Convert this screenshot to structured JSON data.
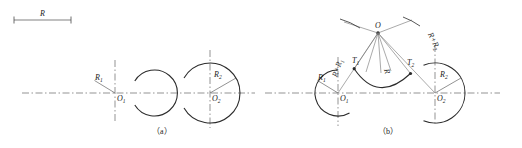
{
  "figure": {
    "title_visible": false,
    "panels": [
      {
        "id": "a",
        "caption": "（a）",
        "description": "Two separate circular arcs with centers O1 and O2 on a common horizontal centerline",
        "labels": {
          "radius_left": "R",
          "radius_left_sub": "1",
          "center_left": "O",
          "center_left_sub": "1",
          "radius_right": "R",
          "radius_right_sub": "2",
          "center_right": "O",
          "center_right_sub": "2"
        }
      },
      {
        "id": "b",
        "caption": "（b）",
        "description": "The two arcs joined by a tangent arc of radius R struck from construction point O",
        "labels": {
          "radius_left": "R",
          "radius_left_sub": "1",
          "center_left": "O",
          "center_left_sub": "1",
          "radius_right": "R",
          "radius_right_sub": "2",
          "center_right": "O",
          "center_right_sub": "2",
          "construction_center": "O",
          "sum_left": "R+R",
          "sum_left_sub": "1",
          "sum_right": "R+R",
          "sum_right_sub": "2",
          "blend_radius": "R",
          "tangent_left": "T",
          "tangent_left_sub": "1",
          "tangent_right": "T",
          "tangent_right_sub": "2"
        }
      }
    ],
    "scale_bar": {
      "label": "R",
      "description": "Horizontal dimension bar at top-left indicating length R"
    }
  },
  "style": {
    "line_color": "#2b2b2b",
    "centerline_color": "#555555",
    "construction_color": "#6b6b6b",
    "background": "#ffffff"
  }
}
